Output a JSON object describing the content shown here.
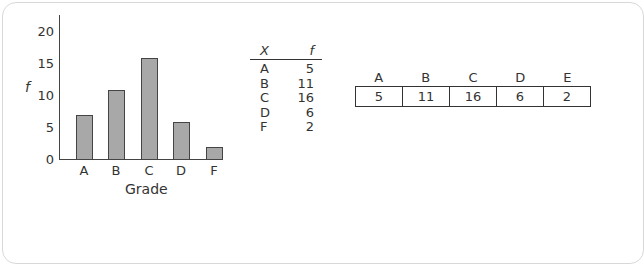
{
  "chart_data": [
    {
      "type": "bar",
      "title": "",
      "xlabel": "Grade",
      "ylabel": "f",
      "categories": [
        "A",
        "B",
        "C",
        "D",
        "F"
      ],
      "values": [
        7,
        11,
        16,
        6,
        2
      ],
      "yticks": [
        "0",
        "5",
        "10",
        "15",
        "20"
      ],
      "ylim": [
        0,
        22
      ],
      "grid": false,
      "legend": null
    },
    {
      "type": "table",
      "columns": [
        "X",
        "f"
      ],
      "rows": [
        [
          "A",
          "5"
        ],
        [
          "B",
          "11"
        ],
        [
          "C",
          "16"
        ],
        [
          "D",
          "6"
        ],
        [
          "F",
          "2"
        ]
      ]
    },
    {
      "type": "table",
      "orientation": "horizontal",
      "headers": [
        "A",
        "B",
        "C",
        "D",
        "E"
      ],
      "values": [
        "5",
        "11",
        "16",
        "6",
        "2"
      ]
    }
  ],
  "colors": {
    "bar_fill": "#a8a8a8",
    "bar_stroke": "#444444",
    "axis": "#444444",
    "text": "#333333"
  }
}
